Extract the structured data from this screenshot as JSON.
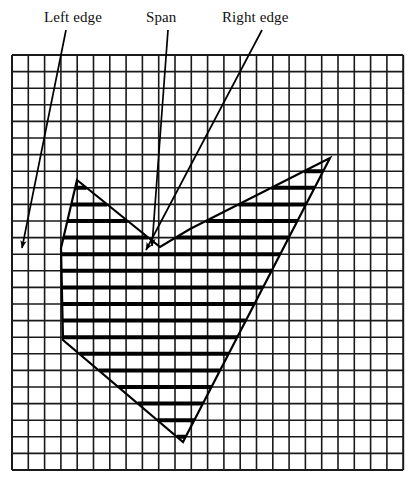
{
  "figure": {
    "kind": "scan-conversion-hatched-polygon-on-grid",
    "background_color": "#ffffff",
    "ink_color": "#000000"
  },
  "labels": {
    "left_edge": "Left edge",
    "span": "Span",
    "right_edge": "Right edge"
  },
  "grid": {
    "origin_x": 12,
    "origin_y": 55,
    "cell_w": 16.3,
    "cell_h": 16.6,
    "cols": 24,
    "rows": 25,
    "line_color": "#1a1a1a",
    "line_width": 1.6,
    "border_width": 2.0
  },
  "polygon": {
    "stroke_color": "#000000",
    "stroke_width": 2.2,
    "description": "W-shaped closed outline: tall left spike, central notch, tall right spike, deep V bottom",
    "points": [
      [
        77,
        180
      ],
      [
        117,
        248
      ],
      [
        153,
        248
      ],
      [
        178,
        292
      ],
      [
        152,
        248
      ],
      [
        160,
        247
      ],
      [
        190,
        229
      ],
      [
        330,
        158
      ],
      [
        302,
        300
      ],
      [
        183,
        442
      ],
      [
        63,
        340
      ],
      [
        61,
        248
      ],
      [
        77,
        180
      ]
    ],
    "outline_path": [
      [
        77,
        180
      ],
      [
        160,
        247
      ],
      [
        190,
        229
      ],
      [
        330,
        158
      ],
      [
        183,
        442
      ],
      [
        63,
        340
      ],
      [
        61,
        248
      ],
      [
        77,
        180
      ]
    ],
    "vertices_named": {
      "left_peak": [
        77,
        180
      ],
      "center_notch": [
        178,
        292
      ],
      "right_peak": [
        330,
        158
      ],
      "bottom_v": [
        183,
        442
      ],
      "left_tail": [
        63,
        340
      ]
    }
  },
  "hatching": {
    "style": "horizontal scanlines on every grid row",
    "stroke_color": "#000000",
    "stroke_width": 4.0,
    "rows_count": 16
  },
  "leaders": [
    {
      "name": "left-edge-leader",
      "label": "Left edge",
      "from": [
        66,
        30
      ],
      "to": [
        22,
        248
      ],
      "arrow_at": [
        50,
        249
      ],
      "arrow_dir": "right",
      "arrow": true
    },
    {
      "name": "span-leader",
      "label": "Span",
      "from": [
        168,
        30
      ],
      "to": [
        152,
        246
      ],
      "arrow_at": [
        152,
        246
      ],
      "arrow_dir": "down-left",
      "arrow": true
    },
    {
      "name": "right-edge-leader",
      "label": "Right edge",
      "from": [
        262,
        30
      ],
      "to": [
        146,
        250
      ],
      "arrow_at": [
        146,
        250
      ],
      "arrow_dir": "left",
      "arrow": true
    }
  ]
}
